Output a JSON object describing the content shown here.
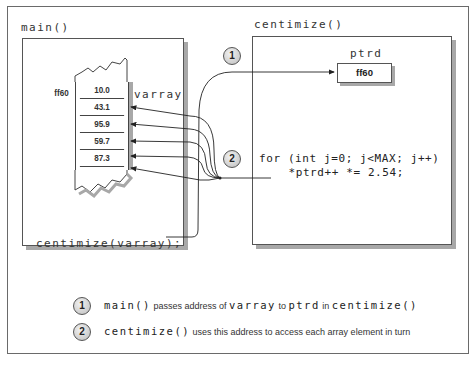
{
  "diagram": {
    "main_scope": {
      "title": "main()",
      "array": {
        "name": "varray",
        "address": "ff60",
        "values": [
          "10.0",
          "43.1",
          "95.9",
          "59.7",
          "87.3"
        ]
      },
      "call": "centimize(varray);"
    },
    "centimize_scope": {
      "title": "centimize()",
      "pointer": {
        "name": "ptrd",
        "value": "ff60"
      },
      "code": [
        "for (int j=0; j<MAX; j++)",
        "  *ptrd++ *= 2.54;"
      ]
    },
    "markers": [
      {
        "number": "1"
      },
      {
        "number": "2"
      }
    ],
    "legend": [
      {
        "number": "1",
        "parts": [
          {
            "text": "main()",
            "mono": true
          },
          {
            "text": " passes address of ",
            "mono": false
          },
          {
            "text": "varray",
            "mono": true
          },
          {
            "text": " to ",
            "mono": false
          },
          {
            "text": "ptrd",
            "mono": true
          },
          {
            "text": " in ",
            "mono": false
          },
          {
            "text": "centimize()",
            "mono": true
          }
        ]
      },
      {
        "number": "2",
        "parts": [
          {
            "text": "centimize()",
            "mono": true
          },
          {
            "text": " uses this address to access each array element in turn",
            "mono": false
          }
        ]
      }
    ],
    "colors": {
      "line": "#333333",
      "shadow": "#a8a8a8",
      "badge_fill": "#cfcfcf"
    }
  }
}
